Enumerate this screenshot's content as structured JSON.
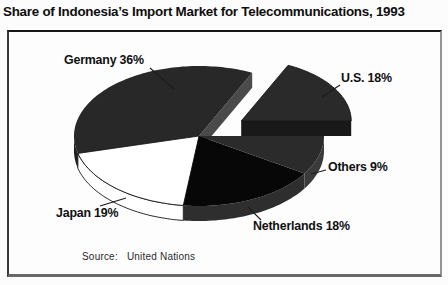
{
  "chart_data": {
    "type": "pie",
    "title": "Share of Indonesia’s Import Market for Telecommunications, 1993",
    "unit": "%",
    "source_label": "Source:",
    "source": "United Nations",
    "slices": [
      {
        "name": "U.S.",
        "value": 18,
        "display_label": "U.S. 18%",
        "color": "#2a2a2a",
        "side_color": "#1f1f1f",
        "start_wall_color": "#191919",
        "outline": "#161616",
        "exploded": true
      },
      {
        "name": "Germany",
        "value": 36,
        "display_label": "Germany 36%",
        "color": "#282828",
        "side_color": "#1e1e1e",
        "start_wall_color": "#4a4a4a",
        "exploded": false
      },
      {
        "name": "Japan",
        "value": 19,
        "display_label": "Japan 19%",
        "color": "#ffffff",
        "side_color": "#ffffff",
        "outline": "#141414",
        "exploded": false
      },
      {
        "name": "Netherlands",
        "value": 18,
        "display_label": "Netherlands 18%",
        "color": "#070707",
        "side_color": "#2e2e2e",
        "exploded": false
      },
      {
        "name": "Others",
        "value": 9,
        "display_label": "Others 9%",
        "color": "#2b2b2b",
        "side_color": "#3a3a3a",
        "exploded": false
      }
    ],
    "layout": {
      "cx": 199,
      "cy": 136,
      "rx": 125,
      "ry": 70,
      "depth": 15,
      "start_angle": 0,
      "direction": "ccw",
      "explode_fraction": 0.4,
      "explode_scale": 0.88,
      "legend": "none",
      "grid": false,
      "label_pos": [
        [
          341,
          71
        ],
        [
          64,
          53
        ],
        [
          56,
          206
        ],
        [
          253,
          219
        ],
        [
          328,
          160
        ]
      ],
      "leaders": [
        [
          340,
          85,
          322,
          97
        ],
        [
          150,
          68,
          174,
          89
        ],
        [
          100,
          206,
          126,
          198
        ],
        [
          248,
          207,
          261,
          220
        ],
        [
          326,
          170,
          311,
          174
        ]
      ]
    }
  }
}
